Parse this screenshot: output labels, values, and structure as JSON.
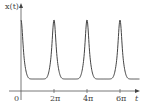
{
  "chart_data": {
    "type": "line",
    "title": "",
    "xlabel": "t",
    "ylabel": "x(t)",
    "x_ticks": [
      "0",
      "2π",
      "4π",
      "6π"
    ],
    "x_tick_values": [
      0,
      6.2832,
      12.5664,
      18.8496
    ],
    "xlim": [
      -0.8,
      23.5
    ],
    "grid": false,
    "legend": null,
    "series": [
      {
        "name": "x(t)",
        "description": "periodic curve with sharp peaks at t = 0, 2π, 4π, 6π and broad flat minima at odd multiples of π",
        "x": [
          0,
          0.5,
          1.0,
          1.5,
          2.0,
          2.5,
          3.14,
          3.8,
          4.3,
          4.8,
          5.3,
          5.8,
          6.28,
          6.8,
          7.3,
          7.8,
          8.3,
          8.8,
          9.42,
          10.0,
          10.5,
          11.0,
          11.5,
          12.0,
          12.57,
          13.1,
          13.6,
          14.1,
          14.6,
          15.1,
          15.71,
          16.3,
          16.8,
          17.3,
          17.8,
          18.3,
          18.85,
          19.4,
          19.9,
          20.4,
          20.9,
          21.4,
          22.0,
          22.6
        ],
        "y": [
          1.0,
          0.72,
          0.42,
          0.25,
          0.16,
          0.12,
          0.1,
          0.12,
          0.16,
          0.25,
          0.42,
          0.72,
          1.0,
          0.72,
          0.42,
          0.25,
          0.16,
          0.12,
          0.1,
          0.12,
          0.16,
          0.25,
          0.42,
          0.72,
          1.0,
          0.72,
          0.42,
          0.25,
          0.16,
          0.12,
          0.1,
          0.12,
          0.16,
          0.25,
          0.42,
          0.72,
          1.0,
          0.72,
          0.42,
          0.25,
          0.16,
          0.12,
          0.1,
          0.11
        ]
      }
    ]
  },
  "axes": {
    "y_label": "x(t)",
    "x_label": "t",
    "origin_label": "0",
    "ticks": [
      "2π",
      "4π",
      "6π"
    ]
  }
}
